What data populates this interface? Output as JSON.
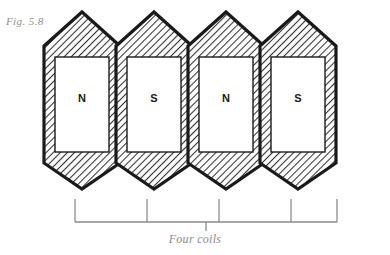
{
  "figure": {
    "label": "Fig. 5.8",
    "caption": "Four coils",
    "label_color": "#8f8f8f",
    "caption_color": "#8a8a8a",
    "outline_color": "#1a1a1a",
    "hatch_color": "#3a3a3a",
    "fill_color": "#ffffff",
    "bracket_color": "#8a8a8a"
  },
  "coils": [
    {
      "pole": "N",
      "index": 1,
      "cx": 82
    },
    {
      "pole": "S",
      "index": 2,
      "cx": 154
    },
    {
      "pole": "N",
      "index": 3,
      "cx": 226
    },
    {
      "pole": "S",
      "index": 4,
      "cx": 298
    }
  ],
  "geometry": {
    "apex_top_y": 12,
    "shoulder_top_y": 46,
    "shoulder_bottom_y": 163,
    "apex_bottom_y": 189,
    "half_width": 38,
    "wall_thickness": 11
  },
  "bracket": {
    "left_x": 75,
    "right_x": 337,
    "tick_top_y": 199,
    "rail_y": 222,
    "stem_bottom_y": 231,
    "ticks": [
      75,
      147,
      219,
      291,
      337
    ]
  }
}
